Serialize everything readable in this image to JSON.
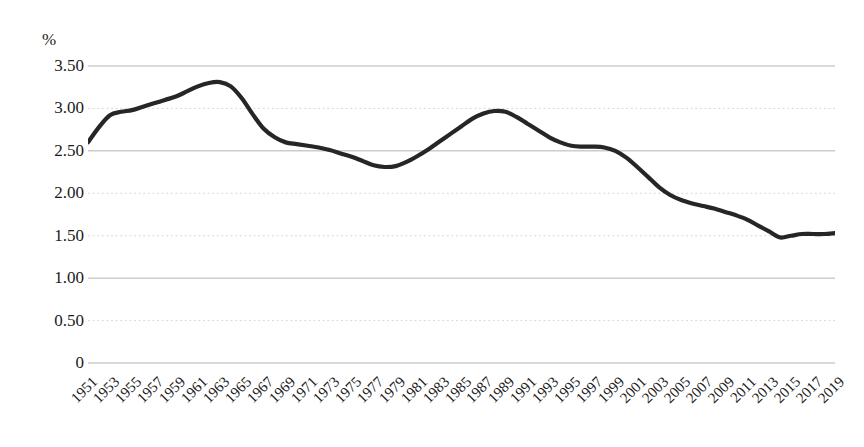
{
  "chart_data": {
    "type": "line",
    "title": "",
    "subtitle": "",
    "xlabel": "",
    "ylabel": "%",
    "unit_label": "%",
    "ylim": [
      0,
      3.5
    ],
    "ytick_labels": [
      "3.50",
      "3.00",
      "2.50",
      "2.00",
      "1.50",
      "1.00",
      "0.50",
      "0"
    ],
    "ytick_values": [
      3.5,
      3.0,
      2.5,
      2.0,
      1.5,
      1.0,
      0.5,
      0
    ],
    "grid": "horizontal-dotted",
    "legend": "none",
    "xtick_labels": [
      "1951",
      "1953",
      "1955",
      "1957",
      "1959",
      "1961",
      "1963",
      "1965",
      "1967",
      "1969",
      "1971",
      "1973",
      "1975",
      "1977",
      "1979",
      "1981",
      "1983",
      "1985",
      "1987",
      "1989",
      "1991",
      "1993",
      "1995",
      "1997",
      "1999",
      "2001",
      "2003",
      "2005",
      "2007",
      "2009",
      "2011",
      "2013",
      "2015",
      "2017",
      "2019"
    ],
    "xlim": [
      1951,
      2019
    ],
    "line_color": "#262626",
    "grid_color": "#d9d9d9",
    "axis_color": "#b3b3b3",
    "x": [
      1951,
      1952,
      1953,
      1954,
      1955,
      1956,
      1957,
      1958,
      1959,
      1960,
      1961,
      1962,
      1963,
      1964,
      1965,
      1966,
      1967,
      1968,
      1969,
      1970,
      1971,
      1972,
      1973,
      1974,
      1975,
      1976,
      1977,
      1978,
      1979,
      1980,
      1981,
      1982,
      1983,
      1984,
      1985,
      1986,
      1987,
      1988,
      1989,
      1990,
      1991,
      1992,
      1993,
      1994,
      1995,
      1996,
      1997,
      1998,
      1999,
      2000,
      2001,
      2002,
      2003,
      2004,
      2005,
      2006,
      2007,
      2008,
      2009,
      2010,
      2011,
      2012,
      2013,
      2014,
      2015,
      2016,
      2017,
      2018,
      2019
    ],
    "values": [
      2.6,
      2.78,
      2.92,
      2.96,
      2.98,
      3.02,
      3.06,
      3.1,
      3.14,
      3.2,
      3.26,
      3.3,
      3.31,
      3.26,
      3.12,
      2.93,
      2.76,
      2.66,
      2.6,
      2.58,
      2.56,
      2.54,
      2.51,
      2.47,
      2.43,
      2.38,
      2.33,
      2.31,
      2.32,
      2.37,
      2.44,
      2.52,
      2.61,
      2.7,
      2.79,
      2.88,
      2.94,
      2.97,
      2.96,
      2.9,
      2.82,
      2.74,
      2.66,
      2.6,
      2.56,
      2.55,
      2.55,
      2.54,
      2.5,
      2.42,
      2.31,
      2.19,
      2.07,
      1.98,
      1.92,
      1.88,
      1.85,
      1.82,
      1.78,
      1.74,
      1.69,
      1.62,
      1.55,
      1.48,
      1.5,
      1.52,
      1.52,
      1.52,
      1.53
    ]
  }
}
